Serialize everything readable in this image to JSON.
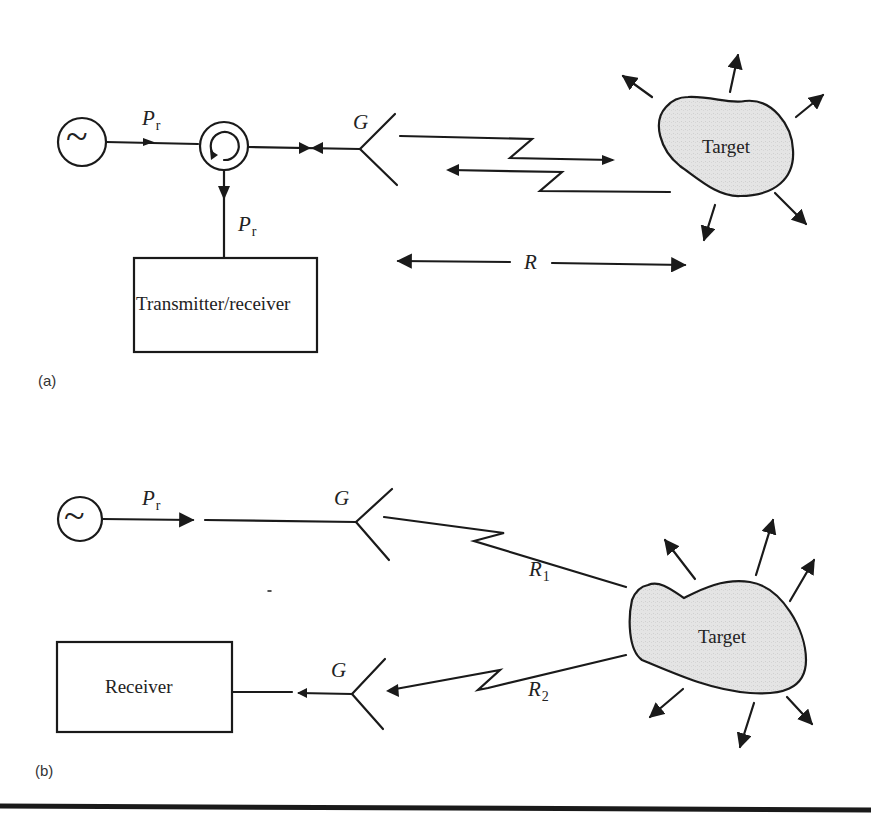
{
  "figure": {
    "panel_a": {
      "label": "(a)",
      "signal_symbol": "~",
      "power_label_1": {
        "main": "P",
        "sub": "r"
      },
      "power_label_2": {
        "main": "P",
        "sub": "r"
      },
      "antenna_gain_label": "G",
      "box_label": "Transmitter/receiver",
      "target_label": "Target",
      "range_label": "R"
    },
    "panel_b": {
      "label": "(b)",
      "signal_symbol": "~",
      "power_label": {
        "main": "P",
        "sub": "r"
      },
      "tx_antenna_gain_label": "G",
      "rx_antenna_gain_label": "G",
      "range_1_label": {
        "main": "R",
        "sub": "1"
      },
      "range_2_label": {
        "main": "R",
        "sub": "2"
      },
      "box_label": "Receiver",
      "target_label": "Target"
    },
    "colors": {
      "line": "#1a1a1a",
      "target_fill": "#e2e2e2",
      "background": "#ffffff"
    }
  }
}
